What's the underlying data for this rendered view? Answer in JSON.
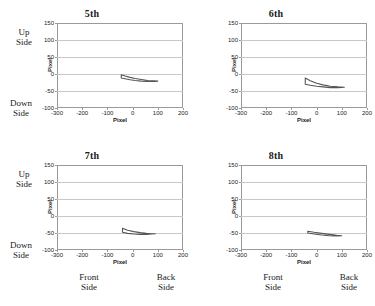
{
  "figure": {
    "annotations": {
      "up_side": "Up\nSide",
      "up_side_line1": "Up",
      "up_side_line2": "Side",
      "down_side_line1": "Down",
      "down_side_line2": "Side",
      "front_side_line1": "Front",
      "front_side_line2": "Side",
      "back_side_line1": "Back",
      "back_side_line2": "Side"
    }
  },
  "chart_data": [
    {
      "type": "line",
      "title": "5th",
      "xlabel": "Pixel",
      "ylabel": "Pixel",
      "xlim": [
        -300,
        200
      ],
      "ylim": [
        -100,
        150
      ],
      "xticks": [
        -300,
        -200,
        -100,
        0,
        100,
        200
      ],
      "yticks": [
        -100,
        -50,
        0,
        50,
        100,
        150
      ],
      "grid": "horizontal",
      "legend": "none",
      "series": [
        {
          "name": "upper-edge",
          "x": [
            -45,
            -30,
            -10,
            10,
            35,
            60,
            85,
            100
          ],
          "y": [
            -2,
            -6,
            -10,
            -13,
            -16,
            -19,
            -20,
            -21
          ]
        },
        {
          "name": "lower-edge",
          "x": [
            -45,
            -30,
            -10,
            10,
            35,
            60,
            85,
            100
          ],
          "y": [
            -12,
            -14,
            -17,
            -19,
            -21,
            -22,
            -22,
            -21
          ]
        }
      ]
    },
    {
      "type": "line",
      "title": "6th",
      "xlabel": "Pixel",
      "ylabel": "Pixel",
      "xlim": [
        -300,
        200
      ],
      "ylim": [
        -100,
        150
      ],
      "xticks": [
        -300,
        -200,
        -100,
        0,
        100,
        200
      ],
      "yticks": [
        -100,
        -50,
        0,
        50,
        100,
        150
      ],
      "grid": "horizontal",
      "legend": "none",
      "series": [
        {
          "name": "upper-edge",
          "x": [
            -45,
            -25,
            0,
            25,
            55,
            85,
            110
          ],
          "y": [
            -12,
            -20,
            -27,
            -32,
            -36,
            -38,
            -39
          ]
        },
        {
          "name": "lower-edge",
          "x": [
            -45,
            -25,
            0,
            25,
            55,
            85,
            110
          ],
          "y": [
            -30,
            -33,
            -36,
            -38,
            -40,
            -40,
            -39
          ]
        }
      ]
    },
    {
      "type": "line",
      "title": "7th",
      "xlabel": "Pixel",
      "ylabel": "Pixel",
      "xlim": [
        -300,
        200
      ],
      "ylim": [
        -100,
        150
      ],
      "xticks": [
        -300,
        -200,
        -100,
        0,
        100,
        200
      ],
      "yticks": [
        -100,
        -50,
        0,
        50,
        100,
        150
      ],
      "grid": "horizontal",
      "legend": "none",
      "series": [
        {
          "name": "upper-edge",
          "x": [
            -40,
            -20,
            5,
            30,
            55,
            75,
            90
          ],
          "y": [
            -36,
            -42,
            -46,
            -49,
            -51,
            -52,
            -52
          ]
        },
        {
          "name": "lower-edge",
          "x": [
            -40,
            -20,
            5,
            30,
            55,
            75,
            90
          ],
          "y": [
            -48,
            -51,
            -53,
            -54,
            -54,
            -53,
            -52
          ]
        }
      ]
    },
    {
      "type": "line",
      "title": "8th",
      "xlabel": "Pixel",
      "ylabel": "Pixel",
      "xlim": [
        -300,
        200
      ],
      "ylim": [
        -100,
        150
      ],
      "xticks": [
        -300,
        -200,
        -100,
        0,
        100,
        200
      ],
      "yticks": [
        -100,
        -50,
        0,
        50,
        100,
        150
      ],
      "grid": "horizontal",
      "legend": "none",
      "series": [
        {
          "name": "upper-edge",
          "x": [
            -35,
            -10,
            20,
            50,
            80,
            100
          ],
          "y": [
            -45,
            -48,
            -51,
            -54,
            -57,
            -58
          ]
        },
        {
          "name": "lower-edge",
          "x": [
            -35,
            -10,
            20,
            50,
            80,
            100
          ],
          "y": [
            -50,
            -53,
            -56,
            -58,
            -59,
            -58
          ]
        }
      ]
    }
  ]
}
